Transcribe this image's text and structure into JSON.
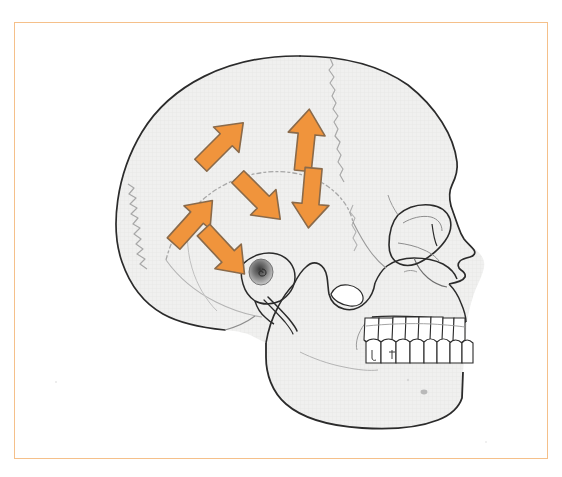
{
  "figure": {
    "caption": "",
    "view": "lateral (side) profile, facing right",
    "frame": {
      "border_color": "#f5c08a",
      "border_width_px": 1.2,
      "background_color": "#ffffff",
      "left": 14,
      "top": 22,
      "width": 534,
      "height": 437
    }
  },
  "palette": {
    "arrow_fill": "#f0943c",
    "arrow_stroke": "#8a6a4a",
    "bone_fill": "#efefef",
    "bone_outline": "#2b2b2b",
    "suture_line": "#a8a8a8",
    "internal_line": "#6e6e6e",
    "tooth_fill": "#ffffff",
    "tooth_outline": "#2b2b2b",
    "ear_canal_shadow": "#7a7a7a",
    "frame_border": "#f5c08a",
    "page_background": "#ffffff"
  },
  "anatomy": {
    "regions": [
      {
        "name": "frontal-bone",
        "label": "Frontal bone"
      },
      {
        "name": "parietal-bone",
        "label": "Parietal bone"
      },
      {
        "name": "occipital-bone",
        "label": "Occipital bone"
      },
      {
        "name": "temporal-bone",
        "label": "Temporal bone"
      },
      {
        "name": "sphenoid-greater-wing",
        "label": "Greater wing of sphenoid"
      },
      {
        "name": "zygomatic-arch",
        "label": "Zygomatic arch"
      },
      {
        "name": "maxilla",
        "label": "Maxilla"
      },
      {
        "name": "mandible",
        "label": "Mandible"
      },
      {
        "name": "nasal-bone",
        "label": "Nasal bone"
      },
      {
        "name": "orbit",
        "label": "Orbit"
      },
      {
        "name": "external-auditory-meatus",
        "label": "External auditory meatus"
      },
      {
        "name": "mastoid-process",
        "label": "Mastoid process"
      },
      {
        "name": "styloid-process",
        "label": "Styloid process"
      }
    ],
    "sutures": [
      {
        "name": "coronal-suture"
      },
      {
        "name": "lambdoid-suture"
      },
      {
        "name": "squamous-suture"
      },
      {
        "name": "sphenosquamous-suture"
      }
    ],
    "teeth": {
      "upper_count": 8,
      "lower_count": 8
    }
  },
  "arrows": [
    {
      "id": "arrow-upper-left-diagonal",
      "name": "arrow-up-left-superior",
      "direction": "up-left",
      "angle_deg": -45,
      "cx": 222,
      "cy": 144,
      "length": 62,
      "shaft_width": 17,
      "head_width": 36,
      "head_length": 26
    },
    {
      "id": "arrow-upper-right-vertical",
      "name": "arrow-up-superior",
      "direction": "up",
      "angle_deg": -84,
      "cx": 306,
      "cy": 140,
      "length": 62,
      "shaft_width": 17,
      "head_width": 37,
      "head_length": 26
    },
    {
      "id": "arrow-mid-center-diagonal",
      "name": "arrow-down-right-middle",
      "direction": "down-right",
      "angle_deg": 45,
      "cx": 259,
      "cy": 198,
      "length": 60,
      "shaft_width": 17,
      "head_width": 36,
      "head_length": 26
    },
    {
      "id": "arrow-mid-right-vertical",
      "name": "arrow-down-middle",
      "direction": "down",
      "angle_deg": 95,
      "cx": 311,
      "cy": 198,
      "length": 60,
      "shaft_width": 17,
      "head_width": 37,
      "head_length": 26
    },
    {
      "id": "arrow-lower-left-diagonal",
      "name": "arrow-up-left-inferior",
      "direction": "up-left",
      "angle_deg": -48,
      "cx": 193,
      "cy": 222,
      "length": 58,
      "shaft_width": 17,
      "head_width": 35,
      "head_length": 25
    },
    {
      "id": "arrow-lower-center-diagonal",
      "name": "arrow-down-right-inferior",
      "direction": "down-right",
      "angle_deg": 47,
      "cx": 224,
      "cy": 252,
      "length": 60,
      "shaft_width": 17,
      "head_width": 36,
      "head_length": 26
    }
  ],
  "chart_data": {
    "type": "diagram",
    "arrow_count": 6,
    "arrow_directions": [
      "up-left",
      "up",
      "down-right",
      "down",
      "up-left",
      "down-right"
    ],
    "annotations": []
  }
}
